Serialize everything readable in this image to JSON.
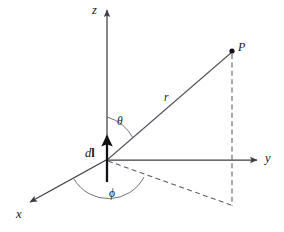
{
  "figure": {
    "background_color": "#ffffff",
    "width": 284,
    "height": 232,
    "axes": [
      {
        "id": "z",
        "label": "z",
        "description": "vertical axis pointing up",
        "arrow_at": "top"
      },
      {
        "id": "y",
        "label": "y",
        "description": "horizontal axis pointing right",
        "arrow_at": "right"
      },
      {
        "id": "x",
        "label": "x",
        "description": "axis pointing down-left toward viewer",
        "arrow_at": "lower-left"
      }
    ],
    "angles": [
      {
        "id": "theta",
        "label": "θ",
        "description": "polar angle between z axis and r"
      },
      {
        "id": "phi",
        "label": "ϕ",
        "description": "azimuthal angle from x axis to projection of r"
      }
    ],
    "vectors": [
      {
        "id": "r",
        "label": "r",
        "description": "radial distance from origin to field point P"
      },
      {
        "id": "dl",
        "label_d": "d",
        "label_l": "l",
        "description": "differential current element at origin, directed along +z"
      }
    ],
    "points": [
      {
        "id": "P",
        "label": "P",
        "description": "field point"
      },
      {
        "id": "origin",
        "label": "",
        "description": "origin of coordinate system"
      }
    ],
    "projections": [
      {
        "id": "xy-projection",
        "style": "dashed",
        "description": "projection of r onto the xy plane"
      },
      {
        "id": "vertical-drop",
        "style": "dashed",
        "description": "vertical dashed line from P down to the xy plane"
      }
    ],
    "colors": {
      "axis": "#3d3d46",
      "ray": "#53535c",
      "dl_vector": "#111115",
      "dashed": "#5a5a63",
      "arc": "#6a6a73",
      "text": "#16161a"
    }
  }
}
